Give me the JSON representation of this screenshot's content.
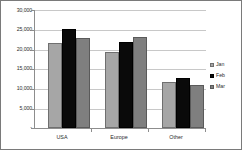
{
  "chart_data": {
    "type": "bar",
    "title": "",
    "subtitle": "",
    "xlabel": "",
    "ylabel": "",
    "categories": [
      "USA",
      "Europe",
      "Other"
    ],
    "series": [
      {
        "name": "Jan",
        "color": "#a6a6a6",
        "values": [
          21700,
          19400,
          11800
        ]
      },
      {
        "name": "Feb",
        "color": "#0a0a0a",
        "values": [
          25300,
          21800,
          12700
        ]
      },
      {
        "name": "Mar",
        "color": "#7f7f7f",
        "values": [
          22900,
          23200,
          10900
        ]
      }
    ],
    "ylim": [
      0,
      30000
    ],
    "ytick_values": [
      0,
      5000,
      10000,
      15000,
      20000,
      25000,
      30000
    ],
    "ytick_labels": [
      "-",
      "5,000",
      "10,000",
      "15,000",
      "20,000",
      "25,000",
      "30,000"
    ],
    "grid": true,
    "grid_axis": "y",
    "legend_position": "right",
    "legend_entries": [
      "Jan",
      "Feb",
      "Mar"
    ],
    "annotations": []
  },
  "axes": {
    "y_labels": [
      {
        "text": "30,000",
        "value": 30000
      },
      {
        "text": "25,000",
        "value": 25000
      },
      {
        "text": "20,000",
        "value": 20000
      },
      {
        "text": "15,000",
        "value": 15000
      },
      {
        "text": "10,000",
        "value": 10000
      },
      {
        "text": "5,000",
        "value": 5000
      },
      {
        "text": "-",
        "value": 0
      }
    ],
    "x_labels": [
      "USA",
      "Europe",
      "Other"
    ]
  },
  "legend": {
    "items": [
      {
        "label": "Jan",
        "swatch": "jan-swatch-icon"
      },
      {
        "label": "Feb",
        "swatch": "feb-swatch-icon"
      },
      {
        "label": "Mar",
        "swatch": "mar-swatch-icon"
      }
    ]
  },
  "colors": {
    "jan": "#a6a6a6",
    "feb": "#0a0a0a",
    "mar": "#7f7f7f",
    "grid": "#c8c8c8",
    "axis": "#8d8d8d",
    "text": "#2b2b2b",
    "frame": "#7a7a7a",
    "background": "#ffffff"
  }
}
